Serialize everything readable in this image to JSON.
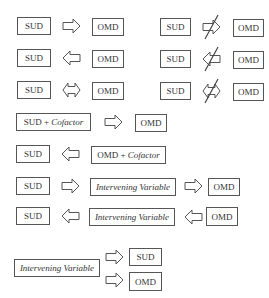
{
  "diagram": {
    "colors": {
      "stroke": "#555555",
      "text": "#333333",
      "background": "#ffffff"
    },
    "left_column": [
      {
        "left": "SUD",
        "arrow": "right",
        "right": "OMD"
      },
      {
        "left": "SUD",
        "arrow": "left",
        "right": "OMD"
      },
      {
        "left": "SUD",
        "arrow": "both",
        "right": "OMD"
      }
    ],
    "right_column": [
      {
        "left": "SUD",
        "arrow": "right-negated",
        "right": "OMD"
      },
      {
        "left": "SUD",
        "arrow": "left-negated",
        "right": "OMD"
      },
      {
        "left": "SUD",
        "arrow": "both-negated",
        "right": "OMD"
      }
    ],
    "cofactor_rows": [
      {
        "left_main": "SUD",
        "left_suffix": " + ",
        "left_italic": "Cofactor",
        "arrow": "right",
        "right": "OMD"
      },
      {
        "left": "SUD",
        "arrow": "left",
        "right_main": "OMD",
        "right_suffix": " + ",
        "right_italic": "Cofactor"
      }
    ],
    "intervening_rows": [
      {
        "left": "SUD",
        "arrow1": "right",
        "middle": "Intervening Variable",
        "arrow2": "right",
        "right": "OMD"
      },
      {
        "left": "SUD",
        "arrow1": "left",
        "middle": "Intervening Variable",
        "arrow2": "left",
        "right": "OMD"
      }
    ],
    "common_cause": {
      "source": "Intervening Variable",
      "targets": [
        "SUD",
        "OMD"
      ],
      "arrows": [
        "right",
        "right"
      ]
    }
  }
}
